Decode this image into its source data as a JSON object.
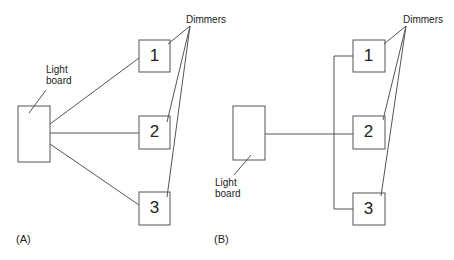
{
  "diagram_a": {
    "caption": "(A)",
    "board_label_line1": "Light",
    "board_label_line2": "board",
    "dimmers_label": "Dimmers",
    "dimmers": [
      "1",
      "2",
      "3"
    ]
  },
  "diagram_b": {
    "caption": "(B)",
    "board_label_line1": "Light",
    "board_label_line2": "board",
    "dimmers_label": "Dimmers",
    "dimmers": [
      "1",
      "2",
      "3"
    ]
  },
  "colors": {
    "stroke": "#555555",
    "text": "#222222"
  }
}
